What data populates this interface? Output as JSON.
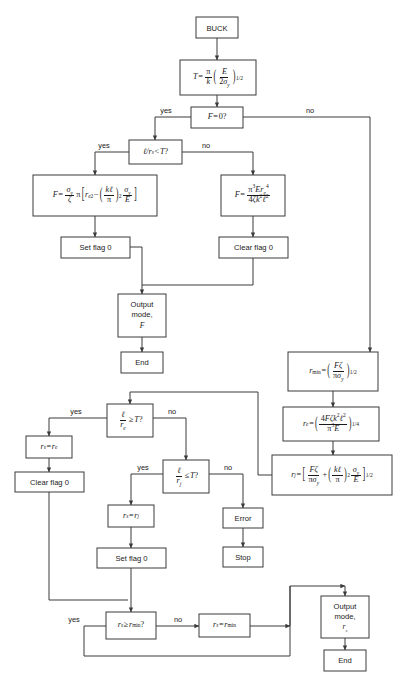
{
  "diagram": {
    "colors": {
      "stroke": "#3a3a3a",
      "text": "#1a1a1a",
      "background": "#ffffff"
    }
  },
  "nodes": {
    "buck": {
      "label": "BUCK",
      "type": "terminal"
    },
    "t_formula": {
      "label": "T = (π/k)(E/2σy)^1/2",
      "type": "process"
    },
    "f_zero": {
      "label": "F = 0?",
      "type": "decision"
    },
    "l_rs_lt_t": {
      "label": "ℓ/rs < T?",
      "type": "decision"
    },
    "f_plastic": {
      "label": "F = (σy/ζ)π[re² − (kℓ/π)² σy/E]",
      "type": "process"
    },
    "f_euler": {
      "label": "F = π³Ere⁴ / 4ζk²ℓ²",
      "type": "process"
    },
    "set_flag_0_a": {
      "label": "Set flag 0",
      "type": "process"
    },
    "clear_flag_0_a": {
      "label": "Clear flag 0",
      "type": "process"
    },
    "output_mode_f": {
      "line1": "Output",
      "line2": "mode,",
      "line3": "F",
      "type": "output"
    },
    "end_a": {
      "label": "End",
      "type": "terminal"
    },
    "r_min": {
      "label": "rmin = (Fζ/πσy)^1/2",
      "type": "process"
    },
    "r_e": {
      "label": "re = (4Fζk²ℓ²/π³E)^1/4",
      "type": "process"
    },
    "r_j": {
      "label": "rj = [Fζ/πσy + (kℓ/π)² σy/E]^1/2",
      "type": "process"
    },
    "l_re_ge_t": {
      "label": "ℓ/re ≥ T?",
      "type": "decision"
    },
    "rs_eq_re": {
      "label": "rs = re",
      "type": "process"
    },
    "clear_flag_0_b": {
      "label": "Clear flag 0",
      "type": "process"
    },
    "l_rj_le_t": {
      "label": "ℓ/rj ≤ T?",
      "type": "decision"
    },
    "rs_eq_rj": {
      "label": "rs = rj",
      "type": "process"
    },
    "set_flag_0_b": {
      "label": "Set flag 0",
      "type": "process"
    },
    "error": {
      "label": "Error",
      "type": "process"
    },
    "stop": {
      "label": "Stop",
      "type": "terminal"
    },
    "rs_ge_rmin": {
      "label": "rs ≥ rmin?",
      "type": "decision"
    },
    "rs_eq_rmin": {
      "label": "rs = rmin",
      "type": "process"
    },
    "output_mode_rs": {
      "line1": "Output",
      "line2": "mode,",
      "line3": "rs",
      "type": "output"
    },
    "end_b": {
      "label": "End",
      "type": "terminal"
    }
  },
  "edge_labels": {
    "f_zero_yes": "yes",
    "f_zero_no": "no",
    "l_rs_yes": "yes",
    "l_rs_no": "no",
    "l_re_yes": "yes",
    "l_re_no": "no",
    "l_rj_yes": "yes",
    "l_rj_no": "no",
    "rs_rmin_yes": "yes",
    "rs_rmin_no": "no"
  },
  "symbols": {
    "T": "T",
    "k": "k",
    "E": "E",
    "F": "F",
    "pi": "π",
    "sigma_y": "σy",
    "zeta": "ζ",
    "ell": "ℓ",
    "r_s": "rs",
    "r_e": "re",
    "r_j": "rj",
    "r_min": "rmin",
    "exp_half": "1/2",
    "exp_quarter": "1/4",
    "exp_two": "2",
    "exp_three": "3",
    "exp_four": "4"
  }
}
